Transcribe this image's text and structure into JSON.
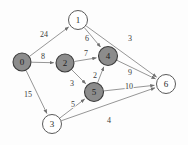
{
  "figure": {
    "width": 188,
    "height": 145,
    "background_color": "#fdfdfd"
  },
  "colors": {
    "visited_node_fill": "#8c8c8c",
    "unvisited_node_fill": "#ffffff",
    "node_stroke": "#3c3c3c",
    "edge_stroke": "#8a8a8a",
    "label_text": "#2a2a2a"
  },
  "chart_data": {
    "type": "diagram",
    "graph_type": "weighted-directed-graph",
    "nodes": [
      {
        "id": "0",
        "label": "0",
        "x": 22,
        "y": 62,
        "r": 9,
        "state": "visited"
      },
      {
        "id": "1",
        "label": "1",
        "x": 78,
        "y": 20,
        "r": 9.5,
        "state": "unvisited"
      },
      {
        "id": "2",
        "label": "2",
        "x": 65,
        "y": 63,
        "r": 9,
        "state": "visited"
      },
      {
        "id": "3",
        "label": "3",
        "x": 52,
        "y": 124,
        "r": 9.5,
        "state": "unvisited"
      },
      {
        "id": "4",
        "label": "4",
        "x": 108,
        "y": 56,
        "r": 9.5,
        "state": "visited"
      },
      {
        "id": "5",
        "label": "5",
        "x": 94,
        "y": 92,
        "r": 9.5,
        "state": "visited"
      },
      {
        "id": "6",
        "label": "6",
        "x": 166,
        "y": 84,
        "r": 9.5,
        "state": "unvisited"
      }
    ],
    "edges": [
      {
        "from": "0",
        "to": "1",
        "weight": "24",
        "lx": 44,
        "ly": 35
      },
      {
        "from": "0",
        "to": "2",
        "weight": "8",
        "lx": 43,
        "ly": 57
      },
      {
        "from": "0",
        "to": "3",
        "weight": "15",
        "lx": 28,
        "ly": 95
      },
      {
        "from": "1",
        "to": "4",
        "weight": "6",
        "lx": 87,
        "ly": 39
      },
      {
        "from": "1",
        "to": "6",
        "weight": "3",
        "lx": 130,
        "ly": 39
      },
      {
        "from": "2",
        "to": "4",
        "weight": "7",
        "lx": 86,
        "ly": 54
      },
      {
        "from": "2",
        "to": "5",
        "weight": "3",
        "lx": 72,
        "ly": 84
      },
      {
        "from": "5",
        "to": "4",
        "weight": "2",
        "lx": 95,
        "ly": 76
      },
      {
        "from": "4",
        "to": "6",
        "weight": "9",
        "lx": 130,
        "ly": 73
      },
      {
        "from": "5",
        "to": "6",
        "weight": "10",
        "lx": 129,
        "ly": 87
      },
      {
        "from": "3",
        "to": "5",
        "weight": "5",
        "lx": 73,
        "ly": 105
      },
      {
        "from": "3",
        "to": "6",
        "weight": "4",
        "lx": 109,
        "ly": 121
      }
    ],
    "legend": [],
    "xlabel": "",
    "ylabel": ""
  }
}
